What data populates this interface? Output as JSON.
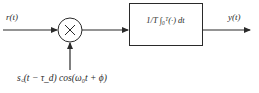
{
  "diagram": {
    "type": "block-diagram",
    "colors": {
      "stroke": "#2a2a2a",
      "background": "#ffffff"
    },
    "nodes": [
      {
        "id": "input",
        "kind": "signal",
        "label": "r(t)"
      },
      {
        "id": "multiplier",
        "kind": "multiplier-circle",
        "symbol": "×"
      },
      {
        "id": "reference",
        "kind": "signal",
        "label": "s_c(t − τ_d) cos(ω_0 t + ϕ)"
      },
      {
        "id": "integrator",
        "kind": "block",
        "label": "(1/T) ∫_0^T (·) dt"
      },
      {
        "id": "output",
        "kind": "signal",
        "label": "y(t)"
      }
    ],
    "edges": [
      {
        "from": "input",
        "to": "multiplier"
      },
      {
        "from": "reference",
        "to": "multiplier"
      },
      {
        "from": "multiplier",
        "to": "integrator"
      },
      {
        "from": "integrator",
        "to": "output"
      }
    ]
  },
  "labels": {
    "input": "r(t)",
    "output": "y(t)",
    "multiplier_symbol": "×",
    "integrator": "1/T ∫₀ᵀ(·) dt",
    "reference": "s꜀(t − τ_d) cos(ω₀t + ϕ)"
  }
}
